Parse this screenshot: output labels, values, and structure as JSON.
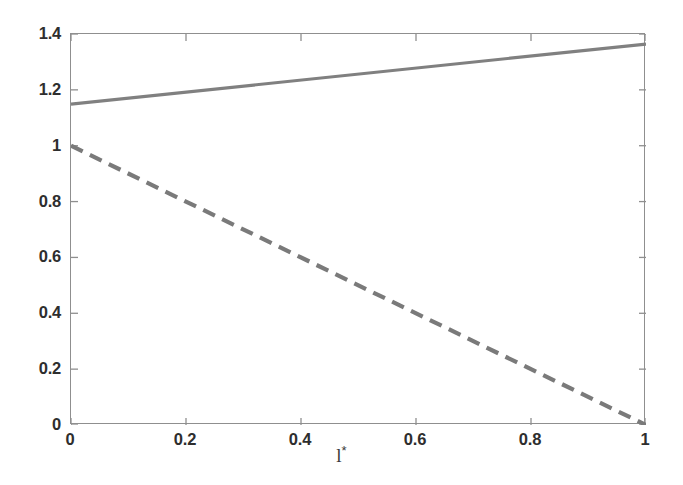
{
  "chart_data": {
    "type": "line",
    "title": "",
    "subtitle": "",
    "xlabel": "l*",
    "xlabel_base": "l",
    "xlabel_superscript": "*",
    "ylabel": "",
    "xlim": [
      0,
      1
    ],
    "ylim": [
      0,
      1.4
    ],
    "xticks": [
      0,
      0.2,
      0.4,
      0.6,
      0.8,
      1
    ],
    "yticks": [
      0,
      0.2,
      0.4,
      0.6,
      0.8,
      1,
      1.2,
      1.4
    ],
    "xtick_labels": [
      "0",
      "0.2",
      "0.4",
      "0.6",
      "0.8",
      "1"
    ],
    "ytick_labels": [
      "0",
      "0.2",
      "0.4",
      "0.6",
      "0.8",
      "1",
      "1.2",
      "1.4"
    ],
    "grid": false,
    "legend": null,
    "legend_position": "none",
    "box": true,
    "series": [
      {
        "name": "solid-line",
        "style": "solid",
        "color": "#808080",
        "linewidth": 3.2,
        "x": [
          0,
          1
        ],
        "values": [
          1.149,
          1.364
        ]
      },
      {
        "name": "dashed-line",
        "style": "dashed",
        "color": "#7a7a7a",
        "linewidth": 4.2,
        "dash": [
          13,
          8
        ],
        "x": [
          0,
          1
        ],
        "values": [
          1.0,
          0.0
        ]
      }
    ]
  },
  "figure": {
    "background_color": "#ffffff",
    "axis_color": "#8f8f8f",
    "text_color": "#2e2e2e"
  }
}
